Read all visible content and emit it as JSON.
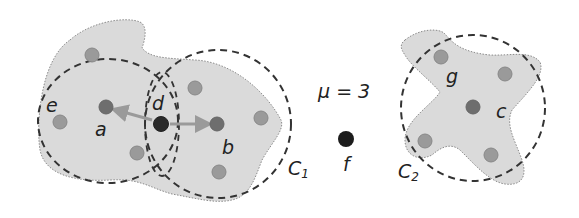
{
  "diagram": {
    "type": "DBSCAN density-based clustering illustration",
    "parameter": {
      "text": "μ = 3",
      "symbol": "μ",
      "value": 3
    },
    "colors": {
      "background": "#ffffff",
      "cluster_fill": "#dadada",
      "cluster_outline": "#8a8a8a",
      "circle_stroke": "#333333",
      "point_border": "#888888",
      "border_point": "#9a9a9a",
      "core_point": "#6e6e6e",
      "noise_point": "#1c1c1c",
      "arrow": "#9a9a9a"
    },
    "clusters": [
      {
        "id": "C1",
        "label": "C",
        "subscript": "1"
      },
      {
        "id": "C2",
        "label": "C",
        "subscript": "2"
      }
    ],
    "points": [
      {
        "id": "a",
        "label": "a",
        "role": "core",
        "cluster": "C1"
      },
      {
        "id": "b",
        "label": "b",
        "role": "core",
        "cluster": "C1"
      },
      {
        "id": "d",
        "label": "d",
        "role": "core-connector",
        "cluster": "C1"
      },
      {
        "id": "e",
        "label": "e",
        "role": "border",
        "cluster": "C1"
      },
      {
        "id": "c",
        "label": "c",
        "role": "core",
        "cluster": "C2"
      },
      {
        "id": "g",
        "label": "g",
        "role": "border",
        "cluster": "C2"
      },
      {
        "id": "f",
        "label": "f",
        "role": "noise",
        "cluster": null
      }
    ],
    "arrows": [
      {
        "from": "d",
        "to": "a"
      },
      {
        "from": "d",
        "to": "b"
      }
    ]
  }
}
